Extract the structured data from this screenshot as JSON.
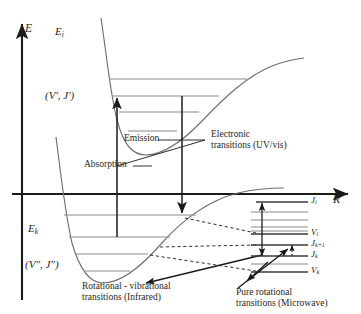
{
  "figure": {
    "type": "energy-level-diagram",
    "axes": {
      "y_label": "E",
      "x_label": "R"
    },
    "curves": [
      {
        "name": "upper-potential",
        "label": "E_i",
        "label_text": "E",
        "label_sub": "i",
        "state_label": "(V′, J′)",
        "levels": 4
      },
      {
        "name": "lower-potential",
        "label": "E_k",
        "label_text": "E",
        "label_sub": "k",
        "state_label": "(V″, J″)",
        "levels": 4
      }
    ],
    "annotations": {
      "absorption": "Absorption",
      "emission": "Emission",
      "electronic_l1": "Electronic",
      "electronic_l2": "transitions (UV/vis)",
      "rovib_l1": "Rotational - vibrational",
      "rovib_l2": "transitions (Infrared)",
      "rot_l1": "Pure rotational",
      "rot_l2": "transitions (Microwave)"
    },
    "inset": {
      "name": "rotational-fine-structure",
      "levels": [
        {
          "text": "J",
          "sub": "i",
          "y": 202
        },
        {
          "text": "V",
          "sub": "i",
          "y": 233
        },
        {
          "text": "J",
          "sub": "k+1",
          "y": 245
        },
        {
          "text": "J",
          "sub": "k",
          "y": 256
        },
        {
          "text": "V",
          "sub": "k",
          "y": 271
        }
      ]
    },
    "colors": {
      "ink": "#231f20",
      "curve": "#6f6f6f",
      "level": "#8a8a8a",
      "axis": "#1a1a1a"
    }
  }
}
